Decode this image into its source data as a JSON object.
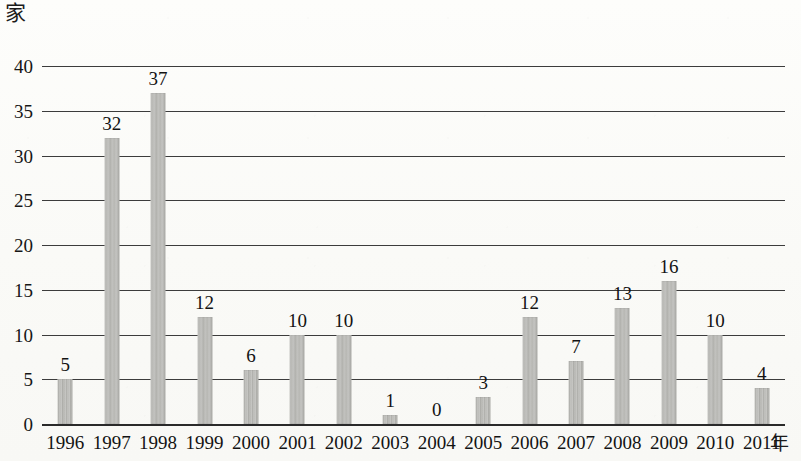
{
  "chart_data": {
    "type": "bar",
    "title": "",
    "xlabel": "年",
    "ylabel": "家",
    "categories": [
      "1996",
      "1997",
      "1998",
      "1999",
      "2000",
      "2001",
      "2002",
      "2003",
      "2004",
      "2005",
      "2006",
      "2007",
      "2008",
      "2009",
      "2010",
      "2011"
    ],
    "values": [
      5,
      32,
      37,
      12,
      6,
      10,
      10,
      1,
      0,
      3,
      12,
      7,
      13,
      16,
      10,
      4
    ],
    "value_labels": [
      "5",
      "32",
      "37",
      "12",
      "6",
      "10",
      "10",
      "1",
      "0",
      "3",
      "12",
      "7",
      "13",
      "16",
      "10",
      "4"
    ],
    "ylim": [
      0,
      40
    ],
    "ytick_values": [
      0,
      5,
      10,
      15,
      20,
      25,
      30,
      35,
      40
    ],
    "ytick_labels": [
      "0",
      "5",
      "10",
      "15",
      "20",
      "25",
      "30",
      "35",
      "40"
    ],
    "grid": true,
    "legend": false,
    "bar_color": "#b8b8b4",
    "gridline_color": "#3c3c3c",
    "axis_color": "#2a2a2a",
    "background_color": "#fbfbf9",
    "text_color": "#131313"
  }
}
